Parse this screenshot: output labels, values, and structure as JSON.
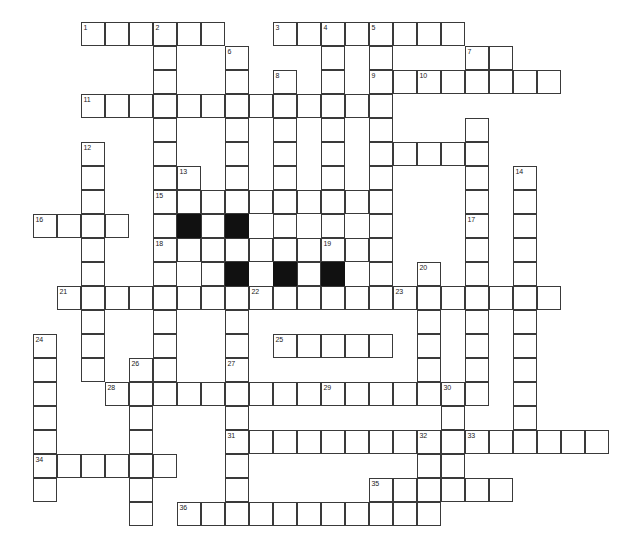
{
  "puzzle": {
    "title": "Crossword Grid",
    "type": "crossword-grid",
    "cell_size_px": 24,
    "grid_origin": {
      "x": 9,
      "y": 22
    },
    "columns": 25,
    "rows": 22,
    "colors": {
      "background": "#ffffff",
      "cell_fill": "#ffffff",
      "cell_border": "#3a3a3a",
      "block_fill": "#111111",
      "number_color": "#1a1a1a"
    },
    "counts": {
      "numbered_cells": 36,
      "block_cells": 5
    },
    "clue_numbers": [
      1,
      2,
      3,
      4,
      5,
      6,
      7,
      8,
      9,
      10,
      11,
      12,
      13,
      14,
      15,
      16,
      17,
      18,
      19,
      20,
      21,
      22,
      23,
      24,
      25,
      26,
      27,
      28,
      29,
      30,
      31,
      32,
      33,
      34,
      35,
      36
    ],
    "entries": [
      {
        "number": 1,
        "direction": "across",
        "row": 0,
        "col": 3,
        "length": 4
      },
      {
        "number": 2,
        "direction": "down",
        "row": 0,
        "col": 6,
        "length": 11
      },
      {
        "number": 3,
        "direction": "across",
        "row": 0,
        "col": 11,
        "length": 8
      },
      {
        "number": 4,
        "direction": "down",
        "row": 0,
        "col": 13,
        "length": 5
      },
      {
        "number": 5,
        "direction": "down",
        "row": 0,
        "col": 15,
        "length": 12
      },
      {
        "number": 6,
        "direction": "down",
        "row": 1,
        "col": 9,
        "length": 11
      },
      {
        "number": 7,
        "direction": "down",
        "row": 1,
        "col": 19,
        "length": 12
      },
      {
        "number": 8,
        "direction": "down",
        "row": 2,
        "col": 11,
        "length": 9
      },
      {
        "number": 9,
        "direction": "across",
        "row": 2,
        "col": 15,
        "length": 9
      },
      {
        "number": 10,
        "direction": "down",
        "row": 2,
        "col": 17,
        "length": 4
      },
      {
        "number": 11,
        "direction": "across",
        "row": 3,
        "col": 3,
        "length": 13
      },
      {
        "number": 12,
        "direction": "down",
        "row": 5,
        "col": 3,
        "length": 16
      },
      {
        "number": 13,
        "direction": "down",
        "row": 6,
        "col": 7,
        "length": 9
      },
      {
        "number": 14,
        "direction": "down",
        "row": 6,
        "col": 21,
        "length": 13
      },
      {
        "number": 15,
        "direction": "across",
        "row": 7,
        "col": 6,
        "length": 9
      },
      {
        "number": 16,
        "direction": "across",
        "row": 8,
        "col": 1,
        "length": 4
      },
      {
        "number": 17,
        "direction": "down",
        "row": 8,
        "col": 19,
        "length": 8
      },
      {
        "number": 18,
        "direction": "across",
        "row": 9,
        "col": 6,
        "length": 10
      },
      {
        "number": 19,
        "direction": "down",
        "row": 9,
        "col": 13,
        "length": 4
      },
      {
        "number": 20,
        "direction": "down",
        "row": 10,
        "col": 17,
        "length": 7
      },
      {
        "number": 21,
        "direction": "across",
        "row": 11,
        "col": 2,
        "length": 8
      },
      {
        "number": 22,
        "direction": "across",
        "row": 11,
        "col": 10,
        "length": 6
      },
      {
        "number": 23,
        "direction": "across",
        "row": 11,
        "col": 16,
        "length": 7
      },
      {
        "number": 24,
        "direction": "down",
        "row": 13,
        "col": 1,
        "length": 8
      },
      {
        "number": 25,
        "direction": "across",
        "row": 13,
        "col": 11,
        "length": 5
      },
      {
        "number": 26,
        "direction": "down",
        "row": 14,
        "col": 5,
        "length": 7
      },
      {
        "number": 27,
        "direction": "down",
        "row": 14,
        "col": 9,
        "length": 7
      },
      {
        "number": 28,
        "direction": "across",
        "row": 15,
        "col": 4,
        "length": 9
      },
      {
        "number": 29,
        "direction": "across",
        "row": 15,
        "col": 13,
        "length": 7
      },
      {
        "number": 30,
        "direction": "down",
        "row": 15,
        "col": 18,
        "length": 6
      },
      {
        "number": 31,
        "direction": "across",
        "row": 17,
        "col": 9,
        "length": 8
      },
      {
        "number": 32,
        "direction": "down",
        "row": 17,
        "col": 17,
        "length": 4
      },
      {
        "number": 33,
        "direction": "across",
        "row": 17,
        "col": 19,
        "length": 6
      },
      {
        "number": 34,
        "direction": "across",
        "row": 18,
        "col": 1,
        "length": 6
      },
      {
        "number": 35,
        "direction": "across",
        "row": 19,
        "col": 15,
        "length": 6
      },
      {
        "number": 36,
        "direction": "across",
        "row": 20,
        "col": 7,
        "length": 11
      }
    ],
    "cells": [
      {
        "r": 0,
        "c": 3,
        "n": "1"
      },
      {
        "r": 0,
        "c": 4
      },
      {
        "r": 0,
        "c": 5
      },
      {
        "r": 0,
        "c": 6,
        "n": "2"
      },
      {
        "r": 0,
        "c": 7
      },
      {
        "r": 0,
        "c": 8
      },
      {
        "r": 0,
        "c": 11,
        "n": "3"
      },
      {
        "r": 0,
        "c": 12
      },
      {
        "r": 0,
        "c": 13,
        "n": "4"
      },
      {
        "r": 0,
        "c": 14
      },
      {
        "r": 0,
        "c": 15,
        "n": "5"
      },
      {
        "r": 0,
        "c": 16
      },
      {
        "r": 0,
        "c": 17
      },
      {
        "r": 0,
        "c": 18
      },
      {
        "r": 1,
        "c": 6
      },
      {
        "r": 1,
        "c": 9,
        "n": "6"
      },
      {
        "r": 1,
        "c": 13
      },
      {
        "r": 1,
        "c": 15
      },
      {
        "r": 1,
        "c": 19,
        "n": "7"
      },
      {
        "r": 1,
        "c": 20
      },
      {
        "r": 2,
        "c": 6
      },
      {
        "r": 2,
        "c": 9
      },
      {
        "r": 2,
        "c": 11,
        "n": "8"
      },
      {
        "r": 2,
        "c": 13
      },
      {
        "r": 2,
        "c": 15,
        "n": "9"
      },
      {
        "r": 2,
        "c": 16
      },
      {
        "r": 2,
        "c": 17,
        "n": "10"
      },
      {
        "r": 2,
        "c": 18
      },
      {
        "r": 2,
        "c": 19
      },
      {
        "r": 2,
        "c": 20
      },
      {
        "r": 2,
        "c": 21
      },
      {
        "r": 2,
        "c": 22
      },
      {
        "r": 3,
        "c": 3,
        "n": "11"
      },
      {
        "r": 3,
        "c": 4
      },
      {
        "r": 3,
        "c": 5
      },
      {
        "r": 3,
        "c": 6
      },
      {
        "r": 3,
        "c": 7
      },
      {
        "r": 3,
        "c": 8
      },
      {
        "r": 3,
        "c": 9
      },
      {
        "r": 3,
        "c": 10
      },
      {
        "r": 3,
        "c": 11
      },
      {
        "r": 3,
        "c": 12
      },
      {
        "r": 3,
        "c": 13
      },
      {
        "r": 3,
        "c": 14
      },
      {
        "r": 3,
        "c": 15
      },
      {
        "r": 4,
        "c": 6
      },
      {
        "r": 4,
        "c": 9
      },
      {
        "r": 4,
        "c": 11
      },
      {
        "r": 4,
        "c": 13
      },
      {
        "r": 4,
        "c": 15
      },
      {
        "r": 4,
        "c": 19
      },
      {
        "r": 5,
        "c": 3,
        "n": "12"
      },
      {
        "r": 5,
        "c": 6
      },
      {
        "r": 5,
        "c": 9
      },
      {
        "r": 5,
        "c": 11
      },
      {
        "r": 5,
        "c": 13
      },
      {
        "r": 5,
        "c": 15
      },
      {
        "r": 5,
        "c": 16
      },
      {
        "r": 5,
        "c": 17
      },
      {
        "r": 5,
        "c": 18
      },
      {
        "r": 5,
        "c": 19
      },
      {
        "r": 6,
        "c": 3
      },
      {
        "r": 6,
        "c": 6
      },
      {
        "r": 6,
        "c": 7,
        "n": "13"
      },
      {
        "r": 6,
        "c": 9
      },
      {
        "r": 6,
        "c": 11
      },
      {
        "r": 6,
        "c": 13
      },
      {
        "r": 6,
        "c": 15
      },
      {
        "r": 6,
        "c": 19
      },
      {
        "r": 6,
        "c": 21,
        "n": "14"
      },
      {
        "r": 7,
        "c": 3
      },
      {
        "r": 7,
        "c": 6,
        "n": "15"
      },
      {
        "r": 7,
        "c": 7
      },
      {
        "r": 7,
        "c": 8
      },
      {
        "r": 7,
        "c": 9
      },
      {
        "r": 7,
        "c": 10
      },
      {
        "r": 7,
        "c": 11
      },
      {
        "r": 7,
        "c": 12
      },
      {
        "r": 7,
        "c": 13
      },
      {
        "r": 7,
        "c": 14
      },
      {
        "r": 7,
        "c": 15
      },
      {
        "r": 7,
        "c": 19
      },
      {
        "r": 7,
        "c": 21
      },
      {
        "r": 8,
        "c": 1,
        "n": "16"
      },
      {
        "r": 8,
        "c": 2
      },
      {
        "r": 8,
        "c": 3
      },
      {
        "r": 8,
        "c": 4
      },
      {
        "r": 8,
        "c": 6
      },
      {
        "r": 8,
        "c": 7,
        "b": true
      },
      {
        "r": 8,
        "c": 8
      },
      {
        "r": 8,
        "c": 9,
        "b": true
      },
      {
        "r": 8,
        "c": 11
      },
      {
        "r": 8,
        "c": 13
      },
      {
        "r": 8,
        "c": 15
      },
      {
        "r": 8,
        "c": 19,
        "n": "17"
      },
      {
        "r": 8,
        "c": 21
      },
      {
        "r": 9,
        "c": 3
      },
      {
        "r": 9,
        "c": 6,
        "n": "18"
      },
      {
        "r": 9,
        "c": 7
      },
      {
        "r": 9,
        "c": 8
      },
      {
        "r": 9,
        "c": 9
      },
      {
        "r": 9,
        "c": 10
      },
      {
        "r": 9,
        "c": 11
      },
      {
        "r": 9,
        "c": 12
      },
      {
        "r": 9,
        "c": 13,
        "n": "19"
      },
      {
        "r": 9,
        "c": 14
      },
      {
        "r": 9,
        "c": 15
      },
      {
        "r": 9,
        "c": 19
      },
      {
        "r": 9,
        "c": 21
      },
      {
        "r": 10,
        "c": 3
      },
      {
        "r": 10,
        "c": 6
      },
      {
        "r": 10,
        "c": 8
      },
      {
        "r": 10,
        "c": 9,
        "b": true
      },
      {
        "r": 10,
        "c": 11,
        "b": true
      },
      {
        "r": 10,
        "c": 12
      },
      {
        "r": 10,
        "c": 13,
        "b": true
      },
      {
        "r": 10,
        "c": 15
      },
      {
        "r": 10,
        "c": 17,
        "n": "20"
      },
      {
        "r": 10,
        "c": 19
      },
      {
        "r": 10,
        "c": 21
      },
      {
        "r": 11,
        "c": 2,
        "n": "21"
      },
      {
        "r": 11,
        "c": 3
      },
      {
        "r": 11,
        "c": 4
      },
      {
        "r": 11,
        "c": 5
      },
      {
        "r": 11,
        "c": 6
      },
      {
        "r": 11,
        "c": 7
      },
      {
        "r": 11,
        "c": 8
      },
      {
        "r": 11,
        "c": 9
      },
      {
        "r": 11,
        "c": 10,
        "n": "22"
      },
      {
        "r": 11,
        "c": 11
      },
      {
        "r": 11,
        "c": 12
      },
      {
        "r": 11,
        "c": 13
      },
      {
        "r": 11,
        "c": 14
      },
      {
        "r": 11,
        "c": 15
      },
      {
        "r": 11,
        "c": 16,
        "n": "23"
      },
      {
        "r": 11,
        "c": 17
      },
      {
        "r": 11,
        "c": 18
      },
      {
        "r": 11,
        "c": 19
      },
      {
        "r": 11,
        "c": 20
      },
      {
        "r": 11,
        "c": 21
      },
      {
        "r": 11,
        "c": 22
      },
      {
        "r": 12,
        "c": 3
      },
      {
        "r": 12,
        "c": 6
      },
      {
        "r": 12,
        "c": 9
      },
      {
        "r": 12,
        "c": 17
      },
      {
        "r": 12,
        "c": 19
      },
      {
        "r": 12,
        "c": 21
      },
      {
        "r": 13,
        "c": 1,
        "n": "24"
      },
      {
        "r": 13,
        "c": 3
      },
      {
        "r": 13,
        "c": 6
      },
      {
        "r": 13,
        "c": 9
      },
      {
        "r": 13,
        "c": 11,
        "n": "25"
      },
      {
        "r": 13,
        "c": 12
      },
      {
        "r": 13,
        "c": 13
      },
      {
        "r": 13,
        "c": 14
      },
      {
        "r": 13,
        "c": 15
      },
      {
        "r": 13,
        "c": 17
      },
      {
        "r": 13,
        "c": 19
      },
      {
        "r": 13,
        "c": 21
      },
      {
        "r": 14,
        "c": 1
      },
      {
        "r": 14,
        "c": 3
      },
      {
        "r": 14,
        "c": 5,
        "n": "26"
      },
      {
        "r": 14,
        "c": 6
      },
      {
        "r": 14,
        "c": 9,
        "n": "27"
      },
      {
        "r": 14,
        "c": 17
      },
      {
        "r": 14,
        "c": 19
      },
      {
        "r": 14,
        "c": 21
      },
      {
        "r": 15,
        "c": 1
      },
      {
        "r": 15,
        "c": 4,
        "n": "28"
      },
      {
        "r": 15,
        "c": 5
      },
      {
        "r": 15,
        "c": 6
      },
      {
        "r": 15,
        "c": 7
      },
      {
        "r": 15,
        "c": 8
      },
      {
        "r": 15,
        "c": 9
      },
      {
        "r": 15,
        "c": 10
      },
      {
        "r": 15,
        "c": 11
      },
      {
        "r": 15,
        "c": 12
      },
      {
        "r": 15,
        "c": 13,
        "n": "29"
      },
      {
        "r": 15,
        "c": 14
      },
      {
        "r": 15,
        "c": 15
      },
      {
        "r": 15,
        "c": 16
      },
      {
        "r": 15,
        "c": 17
      },
      {
        "r": 15,
        "c": 18,
        "n": "30"
      },
      {
        "r": 15,
        "c": 19
      },
      {
        "r": 15,
        "c": 21
      },
      {
        "r": 16,
        "c": 1
      },
      {
        "r": 16,
        "c": 5
      },
      {
        "r": 16,
        "c": 9
      },
      {
        "r": 16,
        "c": 18
      },
      {
        "r": 16,
        "c": 21
      },
      {
        "r": 17,
        "c": 1
      },
      {
        "r": 17,
        "c": 5
      },
      {
        "r": 17,
        "c": 9,
        "n": "31"
      },
      {
        "r": 17,
        "c": 10
      },
      {
        "r": 17,
        "c": 11
      },
      {
        "r": 17,
        "c": 12
      },
      {
        "r": 17,
        "c": 13
      },
      {
        "r": 17,
        "c": 14
      },
      {
        "r": 17,
        "c": 15
      },
      {
        "r": 17,
        "c": 16
      },
      {
        "r": 17,
        "c": 17,
        "n": "32"
      },
      {
        "r": 17,
        "c": 18
      },
      {
        "r": 17,
        "c": 19,
        "n": "33"
      },
      {
        "r": 17,
        "c": 20
      },
      {
        "r": 17,
        "c": 21
      },
      {
        "r": 17,
        "c": 22
      },
      {
        "r": 17,
        "c": 23
      },
      {
        "r": 17,
        "c": 24
      },
      {
        "r": 18,
        "c": 1,
        "n": "34"
      },
      {
        "r": 18,
        "c": 2
      },
      {
        "r": 18,
        "c": 3
      },
      {
        "r": 18,
        "c": 4
      },
      {
        "r": 18,
        "c": 5
      },
      {
        "r": 18,
        "c": 6
      },
      {
        "r": 18,
        "c": 9
      },
      {
        "r": 18,
        "c": 17
      },
      {
        "r": 18,
        "c": 18
      },
      {
        "r": 19,
        "c": 1
      },
      {
        "r": 19,
        "c": 5
      },
      {
        "r": 19,
        "c": 9
      },
      {
        "r": 19,
        "c": 15,
        "n": "35"
      },
      {
        "r": 19,
        "c": 16
      },
      {
        "r": 19,
        "c": 17
      },
      {
        "r": 19,
        "c": 18
      },
      {
        "r": 19,
        "c": 19
      },
      {
        "r": 19,
        "c": 20
      },
      {
        "r": 20,
        "c": 5
      },
      {
        "r": 20,
        "c": 7,
        "n": "36"
      },
      {
        "r": 20,
        "c": 8
      },
      {
        "r": 20,
        "c": 9
      },
      {
        "r": 20,
        "c": 10
      },
      {
        "r": 20,
        "c": 11
      },
      {
        "r": 20,
        "c": 12
      },
      {
        "r": 20,
        "c": 13
      },
      {
        "r": 20,
        "c": 14
      },
      {
        "r": 20,
        "c": 15
      },
      {
        "r": 20,
        "c": 16
      },
      {
        "r": 20,
        "c": 17
      }
    ]
  }
}
